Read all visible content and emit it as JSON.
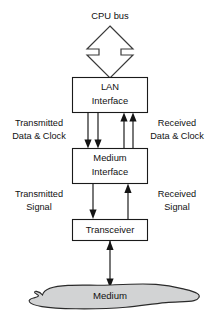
{
  "diagram": {
    "title_label": "CPU bus",
    "nodes": [
      {
        "id": "lan",
        "line1": "LAN",
        "line2": "Interface"
      },
      {
        "id": "medium_interface",
        "line1": "Medium",
        "line2": "Interface"
      },
      {
        "id": "transceiver",
        "line1": "Transceiver",
        "line2": ""
      },
      {
        "id": "medium",
        "line1": "Medium",
        "line2": ""
      }
    ],
    "edge_labels": [
      {
        "id": "transmitted_data_clock",
        "line1": "Transmitted",
        "line2": "Data & Clock"
      },
      {
        "id": "received_data_clock",
        "line1": "Received",
        "line2": "Data & Clock"
      },
      {
        "id": "transmitted_signal",
        "line1": "Transmitted",
        "line2": "Signal"
      },
      {
        "id": "received_signal",
        "line1": "Received",
        "line2": "Signal"
      }
    ],
    "colors": {
      "stroke": "#141414",
      "box_fill": "#ffffff",
      "medium_fill": "#d2d3d4",
      "background": "#ffffff"
    }
  }
}
